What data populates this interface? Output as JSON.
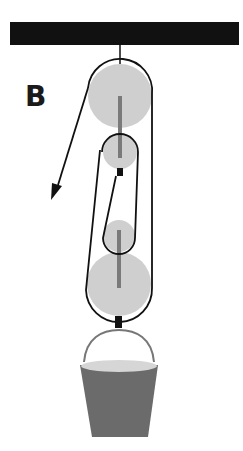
{
  "diagram": {
    "label": "B",
    "colors": {
      "beam": "#111111",
      "pulley_fill": "#cfcfcf",
      "axle": "#7a7a7a",
      "rope": "#111111",
      "bucket": "#6b6b6b",
      "bucket_rim": "#d6d6d6"
    },
    "components": [
      {
        "name": "ceiling-beam"
      },
      {
        "name": "upper-large-pulley"
      },
      {
        "name": "upper-small-pulley"
      },
      {
        "name": "lower-small-pulley"
      },
      {
        "name": "lower-large-pulley"
      },
      {
        "name": "pull-arrow",
        "direction": "down-left"
      },
      {
        "name": "bucket"
      }
    ]
  }
}
